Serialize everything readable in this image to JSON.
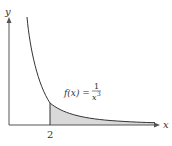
{
  "figure": {
    "y_axis_label": "y",
    "x_axis_label": "x",
    "tick_label": "2",
    "function_label_prefix": "f(x) = ",
    "function_numerator": "1",
    "function_denominator": "x",
    "function_exponent": "3",
    "shaded_region": "area under f(x) from x = 2 to infinity",
    "colors": {
      "axis": "#555555",
      "curve": "#333333",
      "shade": "#d9d9d9"
    }
  }
}
